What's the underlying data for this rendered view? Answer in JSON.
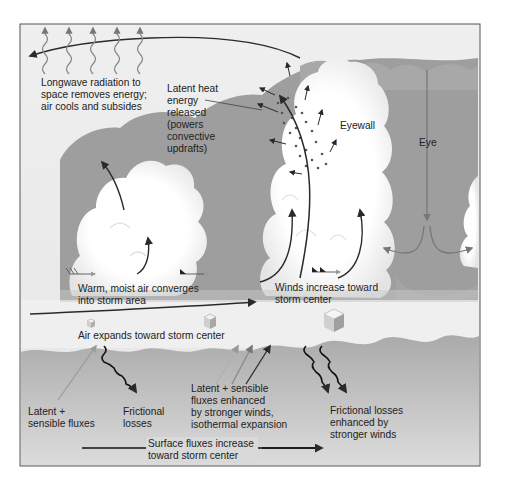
{
  "diagram": {
    "colors": {
      "sky": "#ececec",
      "dark_cloud": "#9b9b9b",
      "white_cloud": "#fbfbfb",
      "ocean": "#b4b4b4",
      "arrow": "#2a2a2a",
      "grey_arrow": "#7a7a7a",
      "frame": "#555555"
    },
    "labels": {
      "longwave": "Longwave radiation to\nspace removes energy;\nair cools and subsides",
      "latent_heat": "Latent heat\nenergy\nreleased\n(powers\nconvective\nupdrafts)",
      "eyewall": "Eyewall",
      "eye": "Eye",
      "warm_moist": "Warm, moist air converges\ninto storm area",
      "winds_increase": "Winds increase toward\nstorm center",
      "air_expands": "Air expands toward storm center",
      "latent_sensible": "Latent +\nsensible fluxes",
      "frictional": "Frictional\nlosses",
      "latent_enhanced": "Latent + sensible\nfluxes enhanced\nby stronger winds,\nisothermal expansion",
      "frictional_enhanced": "Frictional losses\nenhanced by\nstronger winds",
      "surface_fluxes": "Surface fluxes increase\ntoward storm center"
    }
  }
}
